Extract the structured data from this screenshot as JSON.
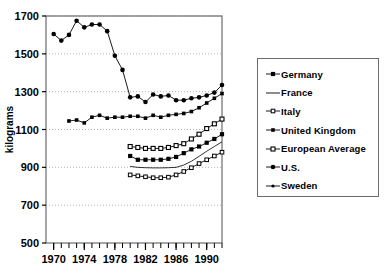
{
  "chart_data": {
    "type": "line",
    "title": "",
    "xlabel": "",
    "ylabel": "kilograms",
    "xlim": [
      1969,
      1992
    ],
    "ylim": [
      500,
      1700
    ],
    "grid": true,
    "legend_position": "right",
    "x_tick_labels": [
      "1970",
      "1974",
      "1978",
      "1982",
      "1986",
      "1990"
    ],
    "x_major_ticks": [
      1970,
      1974,
      1978,
      1982,
      1986,
      1990
    ],
    "x_minor_ticks": [
      1970,
      1971,
      1972,
      1973,
      1974,
      1975,
      1976,
      1977,
      1978,
      1979,
      1980,
      1981,
      1982,
      1983,
      1984,
      1985,
      1986,
      1987,
      1988,
      1989,
      1990,
      1991,
      1992
    ],
    "y_tick_labels": [
      "500",
      "700",
      "900",
      "1100",
      "1300",
      "1500",
      "1700"
    ],
    "y_ticks": [
      500,
      700,
      900,
      1100,
      1300,
      1500,
      1700
    ],
    "series": [
      {
        "name": "U.S.",
        "marker": "filled-circle",
        "x": [
          1970,
          1971,
          1972,
          1973,
          1974,
          1975,
          1976,
          1977,
          1978,
          1979,
          1980,
          1981,
          1982,
          1983,
          1984,
          1985,
          1986,
          1987,
          1988,
          1989,
          1990,
          1991,
          1992
        ],
        "values": [
          1605,
          1570,
          1600,
          1675,
          1640,
          1655,
          1655,
          1620,
          1490,
          1415,
          1270,
          1275,
          1245,
          1285,
          1275,
          1280,
          1255,
          1255,
          1265,
          1270,
          1280,
          1295,
          1335
        ]
      },
      {
        "name": "United Kingdom",
        "marker": "small-filled-square",
        "x": [
          1972,
          1973,
          1974,
          1975,
          1976,
          1977,
          1978,
          1979,
          1980,
          1981,
          1982,
          1983,
          1984,
          1985,
          1986,
          1987,
          1988,
          1989,
          1990,
          1991,
          1992
        ],
        "values": [
          1145,
          1150,
          1135,
          1165,
          1175,
          1160,
          1165,
          1165,
          1170,
          1170,
          1160,
          1175,
          1165,
          1175,
          1180,
          1185,
          1195,
          1215,
          1240,
          1265,
          1290
        ]
      },
      {
        "name": "European Average",
        "marker": "open-square",
        "x": [
          1980,
          1981,
          1982,
          1983,
          1984,
          1985,
          1986,
          1987,
          1988,
          1989,
          1990,
          1991,
          1992
        ],
        "values": [
          1010,
          1005,
          1000,
          1000,
          1000,
          1005,
          1015,
          1025,
          1050,
          1075,
          1105,
          1130,
          1155
        ]
      },
      {
        "name": "Germany",
        "marker": "filled-square",
        "x": [
          1980,
          1981,
          1982,
          1983,
          1984,
          1985,
          1986,
          1987,
          1988,
          1989,
          1990,
          1991,
          1992
        ],
        "values": [
          960,
          940,
          940,
          940,
          940,
          945,
          955,
          975,
          995,
          1010,
          1030,
          1050,
          1075
        ]
      },
      {
        "name": "France",
        "marker": "line-only",
        "x": [
          1980,
          1981,
          1982,
          1983,
          1984,
          1985,
          1986,
          1987,
          1988,
          1989,
          1990,
          1991,
          1992
        ],
        "values": [
          905,
          900,
          898,
          897,
          897,
          898,
          900,
          912,
          932,
          958,
          985,
          1010,
          1035
        ]
      },
      {
        "name": "Italy",
        "marker": "open-square-small",
        "x": [
          1980,
          1981,
          1982,
          1983,
          1984,
          1985,
          1986,
          1987,
          1988,
          1989,
          1990,
          1991,
          1992
        ],
        "values": [
          860,
          855,
          850,
          845,
          845,
          848,
          860,
          878,
          898,
          920,
          940,
          960,
          980
        ]
      },
      {
        "name": "Sweden",
        "marker": "small-star",
        "x": [],
        "values": []
      }
    ]
  },
  "legend": {
    "items": [
      {
        "label": "Germany",
        "marker": "filled-square"
      },
      {
        "label": "France",
        "marker": "line-only"
      },
      {
        "label": "Italy",
        "marker": "open-square-small"
      },
      {
        "label": "United Kingdom",
        "marker": "small-filled-square"
      },
      {
        "label": "European Average",
        "marker": "open-square"
      },
      {
        "label": "U.S.",
        "marker": "filled-circle"
      },
      {
        "label": "Sweden",
        "marker": "small-star"
      }
    ]
  },
  "colors": {
    "line": "#000000",
    "grid": "#b5b5b5",
    "axis": "#6b6b6b",
    "background": "#ffffff"
  }
}
